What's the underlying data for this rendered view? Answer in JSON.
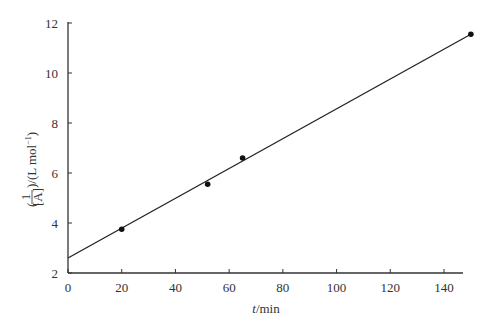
{
  "chart_data": {
    "type": "scatter",
    "title": "",
    "xlabel": "t/min",
    "ylabel": "(1/[A])/(L mol⁻¹)",
    "xlim": [
      0,
      147
    ],
    "ylim": [
      2,
      12
    ],
    "xticks": [
      0,
      20,
      40,
      60,
      80,
      100,
      120,
      140
    ],
    "yticks": [
      2,
      4,
      6,
      8,
      10,
      12
    ],
    "grid": false,
    "legend": null,
    "series": [
      {
        "name": "data",
        "type": "scatter",
        "x": [
          20,
          52,
          65,
          150
        ],
        "y": [
          3.75,
          5.55,
          6.6,
          11.55
        ]
      },
      {
        "name": "linear fit",
        "type": "line",
        "x": [
          0,
          150
        ],
        "y": [
          2.6,
          11.55
        ]
      }
    ]
  },
  "labels": {
    "xlabel_italic": "t",
    "xlabel_rest": "/min",
    "ylabel_frac_num": "1",
    "ylabel_frac_den": "[A]",
    "ylabel_rest": ")/(L mol",
    "ylabel_sup": "−1",
    "ylabel_close": ")",
    "ylabel_open": "("
  }
}
